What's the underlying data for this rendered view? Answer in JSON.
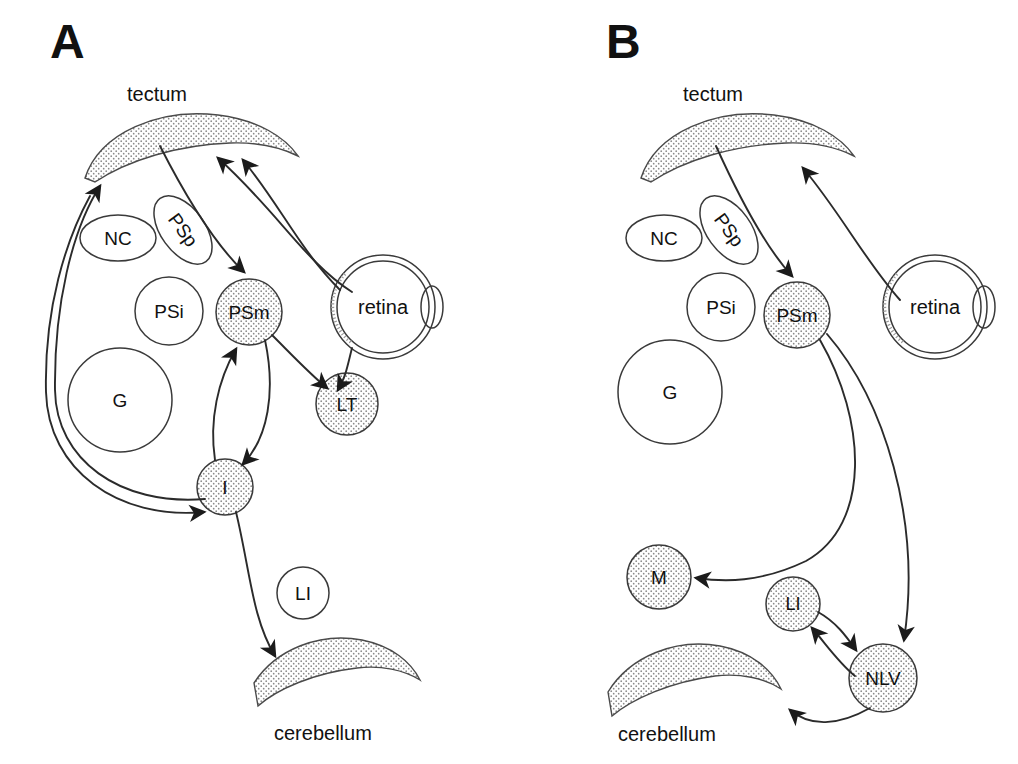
{
  "figure": {
    "type": "neuroanatomical-circuit-diagram",
    "background_color": "#ffffff",
    "ink_color": "#1b1b1b",
    "stipple_color": "#7a7a7a",
    "panel_count": 2
  },
  "panels": [
    {
      "id": "A",
      "letter": "A",
      "regions": [
        {
          "name": "tectum",
          "label": "tectum",
          "shape": "stippled-arc-band"
        },
        {
          "name": "cerebellum",
          "label": "cerebellum",
          "shape": "stippled-arc-band"
        },
        {
          "name": "retina",
          "label": "retina",
          "shape": "eye-circle-with-lens"
        }
      ],
      "nuclei": [
        {
          "name": "NC",
          "label": "NC",
          "shape": "ellipse",
          "fill": "white"
        },
        {
          "name": "PSp",
          "label": "PSp",
          "shape": "ellipse-rotated",
          "fill": "white"
        },
        {
          "name": "PSi",
          "label": "PSi",
          "shape": "circle",
          "fill": "white"
        },
        {
          "name": "PSm",
          "label": "PSm",
          "shape": "circle",
          "fill": "stippled"
        },
        {
          "name": "G",
          "label": "G",
          "shape": "circle",
          "fill": "white"
        },
        {
          "name": "LT",
          "label": "LT",
          "shape": "circle",
          "fill": "stippled"
        },
        {
          "name": "I",
          "label": "I",
          "shape": "circle",
          "fill": "stippled"
        },
        {
          "name": "LI",
          "label": "LI",
          "shape": "circle",
          "fill": "white"
        }
      ],
      "connections": [
        {
          "from": "retina",
          "to": "tectum",
          "arrow": "to"
        },
        {
          "from": "retina",
          "to": "LT",
          "arrow": "to"
        },
        {
          "from": "tectum",
          "to": "PSm",
          "arrow": "to"
        },
        {
          "from": "PSm",
          "to": "LT",
          "arrow": "to"
        },
        {
          "from": "PSm",
          "to": "I",
          "arrow": "to"
        },
        {
          "from": "I",
          "to": "PSm",
          "arrow": "to"
        },
        {
          "from": "I",
          "to": "tectum",
          "arrow": "to"
        },
        {
          "from": "tectum",
          "to": "I",
          "arrow": "to"
        },
        {
          "from": "I",
          "to": "cerebellum",
          "arrow": "to"
        }
      ]
    },
    {
      "id": "B",
      "letter": "B",
      "regions": [
        {
          "name": "tectum",
          "label": "tectum",
          "shape": "stippled-arc-band"
        },
        {
          "name": "cerebellum",
          "label": "cerebellum",
          "shape": "stippled-arc-band"
        },
        {
          "name": "retina",
          "label": "retina",
          "shape": "eye-circle-with-lens"
        }
      ],
      "nuclei": [
        {
          "name": "NC",
          "label": "NC",
          "shape": "ellipse",
          "fill": "white"
        },
        {
          "name": "PSp",
          "label": "PSp",
          "shape": "ellipse-rotated",
          "fill": "white"
        },
        {
          "name": "PSi",
          "label": "PSi",
          "shape": "circle",
          "fill": "white"
        },
        {
          "name": "PSm",
          "label": "PSm",
          "shape": "circle",
          "fill": "stippled"
        },
        {
          "name": "G",
          "label": "G",
          "shape": "circle",
          "fill": "white"
        },
        {
          "name": "M",
          "label": "M",
          "shape": "circle",
          "fill": "stippled"
        },
        {
          "name": "LI",
          "label": "LI",
          "shape": "circle",
          "fill": "stippled"
        },
        {
          "name": "NLV",
          "label": "NLV",
          "shape": "circle",
          "fill": "stippled"
        }
      ],
      "connections": [
        {
          "from": "retina",
          "to": "tectum",
          "arrow": "to"
        },
        {
          "from": "tectum",
          "to": "PSm",
          "arrow": "to"
        },
        {
          "from": "PSm",
          "to": "M",
          "arrow": "to"
        },
        {
          "from": "PSm",
          "to": "NLV",
          "arrow": "to"
        },
        {
          "from": "LI",
          "to": "NLV",
          "arrow": "to"
        },
        {
          "from": "NLV",
          "to": "LI",
          "arrow": "to"
        },
        {
          "from": "NLV",
          "to": "cerebellum",
          "arrow": "to"
        }
      ]
    }
  ],
  "labels": {
    "A": "A",
    "B": "B",
    "tectum": "tectum",
    "cerebellum": "cerebellum",
    "retina": "retina",
    "NC": "NC",
    "PSp": "PSp",
    "PSi": "PSi",
    "PSm": "PSm",
    "G": "G",
    "LT": "LT",
    "I": "I",
    "LI": "LI",
    "M": "M",
    "NLV": "NLV"
  }
}
